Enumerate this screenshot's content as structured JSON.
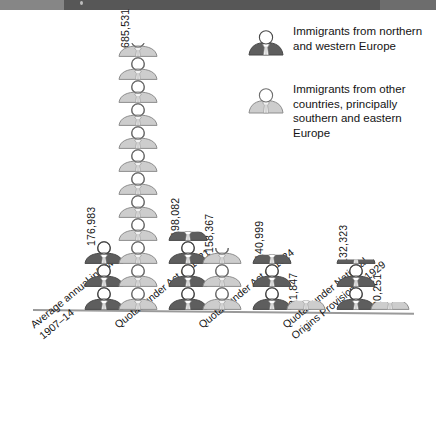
{
  "chart_data": {
    "type": "bar",
    "title": "",
    "subtitle": "",
    "xlabel": "",
    "ylabel": "",
    "unit_note": "pictogram: each figure ≈ 60,000 immigrants",
    "categories": [
      "Average annual inflow 1907–14",
      "Quotas under Act of 1921",
      "Quotas under Act of 1924",
      "Quotas under National Origins Provision of 1929"
    ],
    "series": [
      {
        "name": "Immigrants from northern and western Europe",
        "color": "#595959",
        "values": [
          176983,
          198082,
          140999,
          132323
        ],
        "value_labels": [
          "176,983",
          "198,082",
          "140,999",
          "132,323"
        ]
      },
      {
        "name": "Immigrants from other countries, principally southern and eastern Europe",
        "color": "#c9c9c9",
        "values": [
          685531,
          158367,
          21847,
          20251
        ],
        "value_labels": [
          "685,531",
          "158,367",
          "21,847",
          "20,251"
        ]
      }
    ],
    "ylim": [
      0,
      700000
    ],
    "grid": false,
    "legend_position": "top-right"
  },
  "legend": {
    "items": [
      {
        "icon": "person-bust-dark-icon",
        "label": "Immigrants from northern and western Europe"
      },
      {
        "icon": "person-bust-light-icon",
        "label": "Immigrants from other countries, principally southern and eastern Europe"
      }
    ]
  },
  "axis": {
    "categories": [
      {
        "line1": "Average annual inflow",
        "line2": "1907–14"
      },
      {
        "line1": "Quotas under Act of 1921",
        "line2": ""
      },
      {
        "line1": "Quotas under Act of 1924",
        "line2": ""
      },
      {
        "line1": "Quotas under National",
        "line2": "Origins Provision of 1929"
      }
    ]
  },
  "colors": {
    "dark_figure": "#595959",
    "light_figure": "#c9c9c9",
    "figure_outline": "#4a4a4a",
    "baseline": "#9a9a9a",
    "topbar": "#575757",
    "text": "#141414",
    "background": "#ffffff"
  },
  "layout": {
    "groups": [
      {
        "dark_x": 83,
        "light_x": 117,
        "dark_count": 3.0,
        "light_count": 11.6
      },
      {
        "dark_x": 167,
        "light_x": 201,
        "dark_count": 3.4,
        "light_count": 2.7
      },
      {
        "dark_x": 251,
        "light_x": 285,
        "dark_count": 2.4,
        "light_count": 0.4
      },
      {
        "dark_x": 335,
        "light_x": 369,
        "dark_count": 2.2,
        "light_count": 0.35
      }
    ],
    "figure_height": 23,
    "baseline_y": 299
  }
}
